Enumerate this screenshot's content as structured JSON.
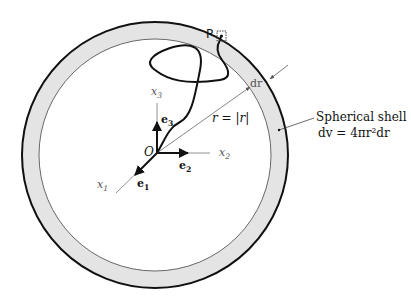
{
  "diagram": {
    "point_label": "P",
    "dr_label": "dr",
    "radius_label": "r = |r|",
    "axes": {
      "x1": "x",
      "x1_sub": "1",
      "x2": "x",
      "x2_sub": "2",
      "x3": "x",
      "x3_sub": "3"
    },
    "basis": {
      "e1": "e",
      "e1_sub": "1",
      "e2": "e",
      "e2_sub": "2",
      "e3": "e",
      "e3_sub": "3"
    },
    "origin_label": "O",
    "shell_label": "Spherical shell",
    "shell_formula": "dv = 4πr²dr",
    "colors": {
      "shell_fill": "#e4e4e4",
      "line": "#111111",
      "thin_line": "#666666"
    }
  }
}
